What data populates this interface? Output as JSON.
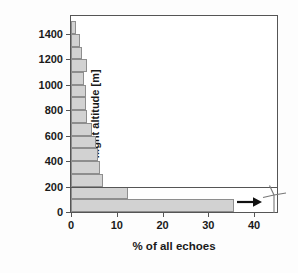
{
  "chart_data": {
    "type": "bar",
    "orientation": "horizontal",
    "title": "",
    "xlabel": "% of all echoes",
    "ylabel": "flight altitude [m]",
    "xlim": [
      0,
      45
    ],
    "ylim": [
      0,
      1540
    ],
    "xticks": [
      0,
      10,
      20,
      30,
      40
    ],
    "xtick_labels": [
      "0",
      "10",
      "20",
      "30",
      "40"
    ],
    "yticks": [
      0,
      200,
      400,
      600,
      800,
      1000,
      1200,
      1400
    ],
    "ytick_labels": [
      "0",
      "200",
      "400",
      "600",
      "800",
      "1000",
      "1200",
      "1400"
    ],
    "grid": false,
    "legend": null,
    "bin_width": 100,
    "categories": [
      "0-100",
      "100-200",
      "200-300",
      "300-400",
      "400-500",
      "500-600",
      "600-700",
      "700-800",
      "800-900",
      "900-1000",
      "1000-1100",
      "1100-1200",
      "1200-1300",
      "1300-1400",
      "1400-1500"
    ],
    "bin_lower": [
      0,
      100,
      200,
      300,
      400,
      500,
      600,
      700,
      800,
      900,
      1000,
      1100,
      1200,
      1300,
      1400
    ],
    "bin_upper": [
      100,
      200,
      300,
      400,
      500,
      600,
      700,
      800,
      900,
      1000,
      1100,
      1200,
      1300,
      1400,
      1500
    ],
    "values": [
      35.5,
      12.5,
      7.0,
      6.3,
      6.0,
      5.5,
      4.6,
      3.6,
      3.3,
      3.3,
      2.9,
      3.6,
      2.4,
      1.9,
      1.0
    ],
    "bar_fill_color": "#d2d2d2",
    "bar_edge_color": "#8e8e8e",
    "axis_color": "#555555",
    "background_color": "#ffffff",
    "annotations": [
      {
        "name": "overflow-arrow",
        "symbol": "arrow-right",
        "near_value_x": 37.5,
        "near_value_y": 50,
        "meaning": "bar continues / overflow to the right"
      },
      {
        "name": "wind-turbine",
        "symbol": "wind-turbine",
        "near_value_x": 42,
        "near_value_y": 85,
        "meaning": "wind turbine rotor height reference"
      },
      {
        "name": "rotor-height-line",
        "symbol": "horizontal-line",
        "at_value_y": 200,
        "meaning": "200 m reference level separating lowest bins"
      }
    ]
  }
}
